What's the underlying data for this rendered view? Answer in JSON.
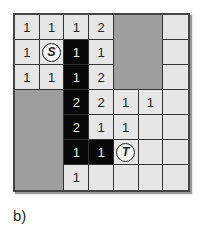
{
  "figure": {
    "caption": "b)",
    "rows": 7,
    "cols": 7,
    "cells": [
      [
        "1",
        "1",
        "1",
        "2",
        "G",
        "G",
        ""
      ],
      [
        "1",
        "S",
        "1",
        "1",
        "G",
        "G",
        ""
      ],
      [
        "1",
        "1",
        "1",
        "2",
        "G",
        "G",
        ""
      ],
      [
        "G",
        "G",
        "2",
        "2",
        "1",
        "1",
        ""
      ],
      [
        "G",
        "G",
        "2",
        "1",
        "1",
        "",
        ""
      ],
      [
        "G",
        "G",
        "1",
        "1",
        "T",
        "",
        ""
      ],
      [
        "G",
        "G",
        "1",
        "",
        "",
        "",
        ""
      ]
    ],
    "black_cells": [
      [
        1,
        2
      ],
      [
        2,
        2
      ],
      [
        3,
        2
      ],
      [
        4,
        2
      ],
      [
        5,
        2
      ],
      [
        5,
        3
      ]
    ],
    "start_label": "S",
    "target_label": "T",
    "colors": {
      "free": "#e6e6e6",
      "obstacle": "#9e9e9e",
      "path": "#080808"
    }
  }
}
